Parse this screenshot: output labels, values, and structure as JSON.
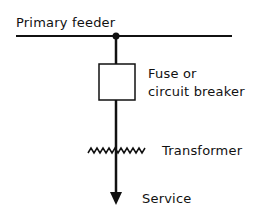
{
  "diagram": {
    "title": "",
    "labels": {
      "primary_feeder": "Primary feeder",
      "fuse_line1": "Fuse or",
      "fuse_line2": "circuit breaker",
      "transformer": "Transformer",
      "service": "Service"
    },
    "colors": {
      "line": "#111111",
      "background": "#ffffff"
    }
  }
}
